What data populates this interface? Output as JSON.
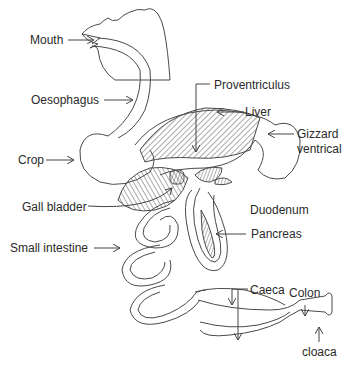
{
  "diagram": {
    "labels": {
      "mouth": "Mouth",
      "oesophagus": "Oesophagus",
      "crop": "Crop",
      "proventriculus": "Proventriculus",
      "liver": "Liver",
      "gizzard_line1": "Gizzard",
      "gizzard_line2": "ventrical",
      "gall_bladder": "Gall bladder",
      "duodenum": "Duodenum",
      "pancreas": "Pancreas",
      "small_intestine": "Small intestine",
      "caeca": "Caeca",
      "colon": "Colon",
      "cloaca": "cloaca"
    },
    "colors": {
      "stroke": "#4a4a4a",
      "text": "#2a2a2a",
      "background": "#ffffff"
    }
  }
}
